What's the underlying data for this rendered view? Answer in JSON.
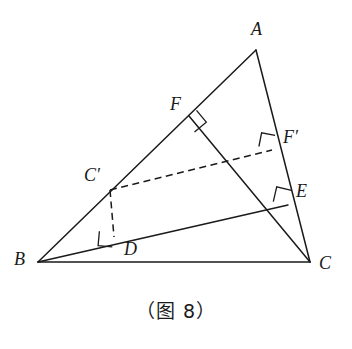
{
  "figure": {
    "caption": "（图 8）",
    "canvas": {
      "width": 352,
      "height": 349,
      "background": "#ffffff"
    },
    "stroke_color": "#1a1a1a",
    "points": [
      {
        "id": "A",
        "label": "A",
        "x": 256,
        "y": 50,
        "label_x": 251,
        "label_y": 20
      },
      {
        "id": "B",
        "label": "B",
        "x": 38,
        "y": 262,
        "label_x": 14,
        "label_y": 250
      },
      {
        "id": "C",
        "label": "C",
        "x": 310,
        "y": 262,
        "label_x": 319,
        "label_y": 254
      },
      {
        "id": "F",
        "label": "F",
        "x": 189,
        "y": 116,
        "label_x": 170,
        "label_y": 95
      },
      {
        "id": "E",
        "label": "E",
        "x": 288,
        "y": 205,
        "label_x": 296,
        "label_y": 182
      },
      {
        "id": "Cp",
        "label": "C′",
        "x": 110,
        "y": 190,
        "label_x": 84,
        "label_y": 166
      },
      {
        "id": "Fp",
        "label": "F′",
        "x": 272,
        "y": 150,
        "label_x": 283,
        "label_y": 128
      },
      {
        "id": "D",
        "label": "D",
        "x": 114,
        "y": 237,
        "label_x": 124,
        "label_y": 240
      }
    ],
    "solid_segments": [
      {
        "name": "segment-AB",
        "from": "A",
        "to": "B"
      },
      {
        "name": "segment-BC",
        "from": "B",
        "to": "C"
      },
      {
        "name": "segment-AC",
        "from": "A",
        "to": "C"
      },
      {
        "name": "segment-CF",
        "from": "C",
        "to": "F"
      },
      {
        "name": "segment-BE",
        "from": "B",
        "to": "E"
      }
    ],
    "dashed_segments": [
      {
        "name": "segment-CprimeFprime",
        "from": "Cp",
        "to": "Fp"
      },
      {
        "name": "segment-CprimeD",
        "from": "Cp",
        "to": "D"
      }
    ],
    "right_angles": [
      {
        "name": "right-angle-at-F",
        "at": "F"
      },
      {
        "name": "right-angle-at-E",
        "at": "E"
      },
      {
        "name": "right-angle-at-Fprime",
        "at": "Fp"
      },
      {
        "name": "right-angle-at-D",
        "at": "D"
      }
    ]
  }
}
